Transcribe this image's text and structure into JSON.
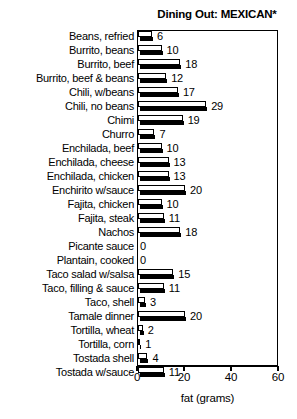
{
  "chart_data": {
    "type": "bar",
    "orientation": "horizontal",
    "title": "Dining Out: MEXICAN*",
    "xlabel": "fat (grams)",
    "ylabel": "",
    "xlim": [
      0,
      60
    ],
    "xticks": [
      0,
      20,
      40,
      60
    ],
    "xtick_labels": [
      "0",
      "20",
      "40",
      "60"
    ],
    "grid": false,
    "legend": null,
    "bar_style": "white-face-with-black-drop-shadow",
    "categories": [
      "Beans, refried",
      "Burrito, beans",
      "Burrito, beef",
      "Burrito, beef & beans",
      "Chili, w/beans",
      "Chili, no beans",
      "Chimi",
      "Churro",
      "Enchilada, beef",
      "Enchilada, cheese",
      "Enchilada, chicken",
      "Enchirito w/sauce",
      "Fajita, chicken",
      "Fajita, steak",
      "Nachos",
      "Picante sauce",
      "Plantain, cooked",
      "Taco salad w/salsa",
      "Taco, filling & sauce",
      "Taco, shell",
      "Tamale dinner",
      "Tortilla, wheat",
      "Tortilla, corn",
      "Tostada shell",
      "Tostada w/sauce"
    ],
    "values": [
      6,
      10,
      18,
      12,
      17,
      29,
      19,
      7,
      10,
      13,
      13,
      20,
      10,
      11,
      18,
      0,
      0,
      15,
      11,
      3,
      20,
      2,
      1,
      4,
      11
    ],
    "value_labels": [
      "6",
      "10",
      "18",
      "12",
      "17",
      "29",
      "19",
      "7",
      "10",
      "13",
      "13",
      "20",
      "10",
      "11",
      "18",
      "0",
      "0",
      "15",
      "11",
      "3",
      "20",
      "2",
      "1",
      "4",
      "11"
    ]
  },
  "colors": {
    "bar_face": "#ffffff",
    "bar_outline": "#000000",
    "bar_shadow": "#000000",
    "axis": "#000000",
    "text": "#000000",
    "background": "#ffffff"
  }
}
